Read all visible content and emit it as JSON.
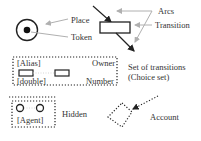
{
  "legend": {
    "place": {
      "label": "Place"
    },
    "token": {
      "label": "Token"
    },
    "arcs": {
      "label": "Arcs"
    },
    "transition": {
      "label": "Transition"
    },
    "choice_set": {
      "label_line1": "Set of transitions",
      "label_line2": "(Choice set)",
      "alias": "[Alias]",
      "owner": "Owner",
      "double": "[double]",
      "number": "Number"
    },
    "hidden": {
      "label": "Hidden",
      "agent": "[Agent]"
    },
    "account": {
      "label": "Account"
    }
  },
  "colors": {
    "stroke": "#222222",
    "pointer": "#b0b0b0",
    "text": "#333333"
  }
}
